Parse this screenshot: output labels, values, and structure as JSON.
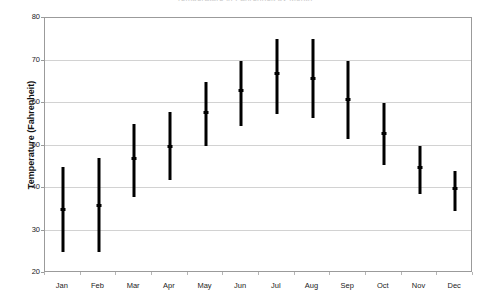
{
  "chart_data": {
    "type": "bar",
    "subtype": "high-low-mean range chart",
    "title": "Temperature in Fahrenheit by Month",
    "xlabel": "",
    "ylabel": "Temperature (Fahrenheit)",
    "ylim": [
      20,
      80
    ],
    "ytick_labels": [
      "20",
      "30",
      "40",
      "50",
      "60",
      "70",
      "80"
    ],
    "ytick_values": [
      20,
      30,
      40,
      50,
      60,
      70,
      80
    ],
    "grid": true,
    "grid_axis": "y",
    "legend": false,
    "categories": [
      "Jan",
      "Feb",
      "Mar",
      "Apr",
      "May",
      "Jun",
      "Jul",
      "Aug",
      "Sep",
      "Oct",
      "Nov",
      "Dec"
    ],
    "series": [
      {
        "name": "High",
        "values": [
          45,
          47,
          55,
          58,
          65,
          70,
          75,
          75,
          70,
          60,
          50,
          44
        ]
      },
      {
        "name": "Low",
        "values": [
          25,
          25,
          38,
          42,
          50,
          54.5,
          57.5,
          56.5,
          51.5,
          45.5,
          38.5,
          34.5
        ]
      },
      {
        "name": "Mean",
        "values": [
          35,
          36,
          47,
          50,
          58,
          63,
          67,
          66,
          61,
          53,
          45,
          40
        ]
      }
    ],
    "bar_color": "#000000",
    "grid_color": "#d2d2d2",
    "axis_color": "#9b9b9b",
    "background": "#ffffff"
  }
}
